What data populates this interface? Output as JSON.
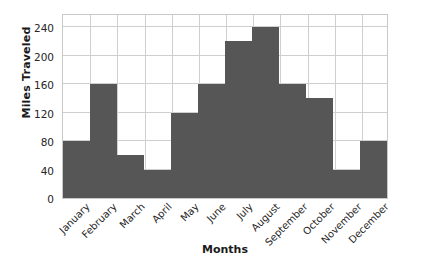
{
  "chart_data": {
    "type": "bar",
    "title": "",
    "xlabel": "Months",
    "ylabel": "Miles Traveled",
    "categories": [
      "January",
      "February",
      "March",
      "April",
      "May",
      "June",
      "July",
      "August",
      "September",
      "October",
      "November",
      "December"
    ],
    "values": [
      80,
      160,
      60,
      40,
      120,
      160,
      220,
      240,
      160,
      140,
      40,
      80
    ],
    "ylim": [
      0,
      260
    ],
    "yticks": [
      0,
      40,
      80,
      120,
      160,
      200,
      240
    ],
    "ytick_labels": [
      "0",
      "40",
      "80",
      "120",
      "160",
      "200",
      "240"
    ],
    "grid": true,
    "legend": "none",
    "bar_color": "#565656",
    "grid_color": "#cfcfcf",
    "axis_border_color": "#c9c9c9",
    "background": "#ffffff",
    "bar_gap": 0
  }
}
